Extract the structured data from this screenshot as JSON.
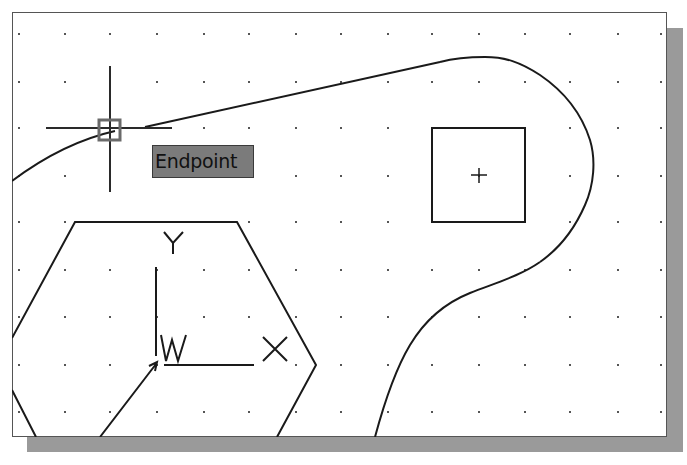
{
  "app": {
    "view": "AutoCAD drawing area (model space)",
    "grid": {
      "visible": true,
      "columns_x": [
        19,
        65,
        110,
        157,
        204,
        249,
        296,
        341,
        388,
        432,
        479,
        525,
        570,
        618,
        661
      ],
      "rows_y": [
        34,
        82,
        128,
        176,
        222,
        270,
        317,
        365,
        412
      ],
      "dot_color": "#555555"
    },
    "colors": {
      "background": "#ffffff",
      "geometry": "#1a1a1a",
      "shadow": "#9a9a9a",
      "tooltip_bg": "#7b7b7b",
      "aperture": "#6a6a6a"
    }
  },
  "osnap": {
    "tooltip_label": "Endpoint",
    "marker_icon": "endpoint-square-icon"
  },
  "cursor": {
    "icon": "crosshair-cursor-icon",
    "x": 110,
    "y": 128
  },
  "ucs_icon": {
    "x_label": "X",
    "y_label": "Y",
    "w_label": "W"
  },
  "entities": [
    {
      "type": "spline",
      "name": "left-curve"
    },
    {
      "type": "line",
      "name": "diagonal-line"
    },
    {
      "type": "arc",
      "name": "right-arc"
    },
    {
      "type": "spline",
      "name": "s-curve"
    },
    {
      "type": "rectangle",
      "name": "square"
    },
    {
      "type": "polygon",
      "name": "hexagon"
    },
    {
      "type": "point",
      "name": "square-center-mark"
    }
  ]
}
